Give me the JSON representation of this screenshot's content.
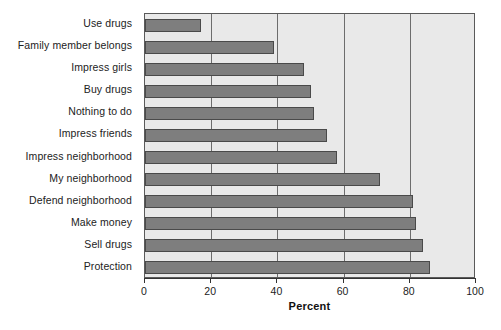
{
  "chart_data": {
    "type": "bar",
    "orientation": "horizontal",
    "title": "",
    "xlabel": "Percent",
    "ylabel": "",
    "xlim": [
      0,
      100
    ],
    "xticks": [
      0,
      20,
      40,
      60,
      80,
      100
    ],
    "xtick_labels": [
      "0",
      "20",
      "40",
      "60",
      "80",
      "100"
    ],
    "grid": "vertical",
    "legend": "none",
    "categories": [
      "Use drugs",
      "Family member belongs",
      "Impress girls",
      "Buy drugs",
      "Nothing to do",
      "Impress friends",
      "Impress neighborhood",
      "My neighborhood",
      "Defend neighborhood",
      "Make money",
      "Sell drugs",
      "Protection"
    ],
    "values": [
      17,
      39,
      48,
      50,
      51,
      55,
      58,
      71,
      81,
      82,
      84,
      86
    ],
    "bar_color": "#7e7e7e",
    "plot_background": "#e9e9e9",
    "axis_color": "#333333"
  }
}
